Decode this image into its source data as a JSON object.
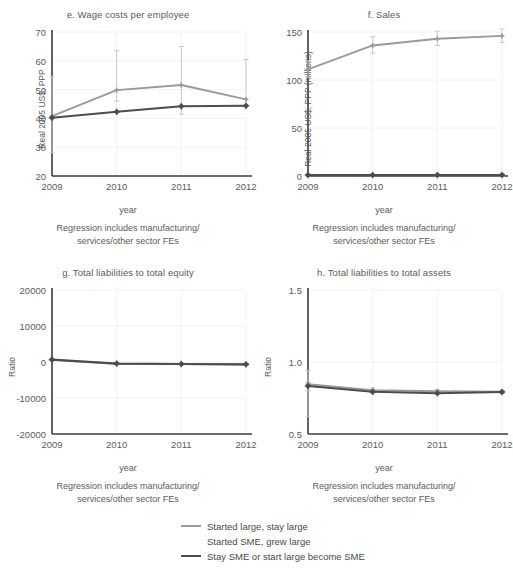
{
  "figure": {
    "xlabel": "year",
    "note_line1": "Regression includes manufacturing/",
    "note_line2": "services/other sector FEs",
    "colors": {
      "series_started_large": "#9a9a9a",
      "series_grew_large": "#ffffff",
      "series_stay_sme": "#4d4d4d",
      "axis": "#3d3d3d",
      "grid": "#f2f2f2",
      "text": "#5b5b5b",
      "background": "#ffffff"
    }
  },
  "legend": {
    "items": [
      {
        "label": "Started large, stay large",
        "color": "#9a9a9a",
        "visible_swatch": true
      },
      {
        "label": "Started SME, grew large",
        "color": "#ffffff",
        "visible_swatch": false
      },
      {
        "label": "Stay SME or start large become SME",
        "color": "#4d4d4d",
        "visible_swatch": true
      }
    ]
  },
  "chart_data": [
    {
      "id": "e",
      "type": "line",
      "title": "e. Wage costs per employee",
      "xlabel": "year",
      "ylabel": "Real 2005 US$, PPP",
      "categories": [
        "2009",
        "2010",
        "2011",
        "2012"
      ],
      "x": [
        2009,
        2010,
        2011,
        2012
      ],
      "ylim": [
        20,
        70
      ],
      "yticks": [
        20,
        30,
        40,
        50,
        60,
        70
      ],
      "grid": true,
      "legend_position": "below-figure",
      "series": [
        {
          "name": "Started large, stay large",
          "color": "#9a9a9a",
          "values": [
            40.8,
            49.8,
            51.6,
            46.6
          ],
          "err_low": [
            28.0,
            46.0,
            41.5,
            44.5
          ],
          "err_high": [
            54.5,
            63.5,
            65.0,
            60.5
          ]
        },
        {
          "name": "Stay SME or start large become SME",
          "color": "#4d4d4d",
          "values": [
            40.2,
            42.3,
            44.2,
            44.4
          ],
          "err_low": [
            40.0,
            42.1,
            44.0,
            44.2
          ],
          "err_high": [
            40.4,
            42.5,
            44.4,
            44.6
          ]
        }
      ]
    },
    {
      "id": "f",
      "type": "line",
      "title": "f. Sales",
      "xlabel": "year",
      "ylabel": "Real 2005 US$, PPP (millions)",
      "categories": [
        "2009",
        "2010",
        "2011",
        "2012"
      ],
      "x": [
        2009,
        2010,
        2011,
        2012
      ],
      "ylim": [
        0,
        150
      ],
      "yticks": [
        0,
        50,
        100,
        150
      ],
      "grid": true,
      "legend_position": "below-figure",
      "series": [
        {
          "name": "Started large, stay large",
          "color": "#9a9a9a",
          "values": [
            111,
            136,
            143,
            146
          ],
          "err_low": [
            103,
            128,
            136,
            139
          ],
          "err_high": [
            120,
            145,
            151,
            153
          ]
        },
        {
          "name": "Stay SME or start large become SME",
          "color": "#4d4d4d",
          "values": [
            1,
            1,
            1,
            1
          ],
          "err_low": [
            0,
            0,
            0,
            0
          ],
          "err_high": [
            2,
            2,
            2,
            2
          ]
        }
      ]
    },
    {
      "id": "g",
      "type": "line",
      "title": "g. Total liabilities to total equity",
      "xlabel": "year",
      "ylabel": "Ratio",
      "categories": [
        "2009",
        "2010",
        "2011",
        "2012"
      ],
      "x": [
        2009,
        2010,
        2011,
        2012
      ],
      "ylim": [
        -20000,
        20000
      ],
      "yticks": [
        -20000,
        -10000,
        0,
        10000,
        20000
      ],
      "grid": true,
      "legend_position": "below-figure",
      "series": [
        {
          "name": "Started large, stay large",
          "color": "#9a9a9a",
          "values": [
            600,
            -500,
            -600,
            -700
          ],
          "err_low": [
            400,
            -700,
            -800,
            -900
          ],
          "err_high": [
            800,
            -300,
            -400,
            -500
          ]
        },
        {
          "name": "Stay SME or start large become SME",
          "color": "#4d4d4d",
          "values": [
            650,
            -450,
            -550,
            -650
          ],
          "err_low": [
            450,
            -650,
            -750,
            -850
          ],
          "err_high": [
            850,
            -250,
            -350,
            -450
          ]
        }
      ]
    },
    {
      "id": "h",
      "type": "line",
      "title": "h. Total liabilities to total assets",
      "xlabel": "year",
      "ylabel": "Ratio",
      "categories": [
        "2009",
        "2010",
        "2011",
        "2012"
      ],
      "x": [
        2009,
        2010,
        2011,
        2012
      ],
      "ylim": [
        0.5,
        1.5
      ],
      "yticks": [
        0.5,
        1.0,
        1.5
      ],
      "grid": true,
      "legend_position": "below-figure",
      "series": [
        {
          "name": "Started large, stay large",
          "color": "#9a9a9a",
          "values": [
            0.845,
            0.805,
            0.797,
            0.793
          ],
          "err_low": [
            0.62,
            0.79,
            0.785,
            0.78
          ],
          "err_high": [
            0.94,
            0.82,
            0.81,
            0.806
          ]
        },
        {
          "name": "Stay SME or start large become SME",
          "color": "#4d4d4d",
          "values": [
            0.833,
            0.793,
            0.783,
            0.792
          ],
          "err_low": [
            0.8,
            0.785,
            0.775,
            0.784
          ],
          "err_high": [
            0.86,
            0.8,
            0.79,
            0.8
          ]
        }
      ]
    }
  ]
}
